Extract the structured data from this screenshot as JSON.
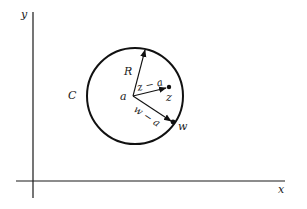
{
  "diagram": {
    "type": "complex-plane-circle",
    "axes": {
      "x_label": "x",
      "y_label": "y"
    },
    "circle": {
      "label": "C",
      "center_label": "a",
      "radius_label": "R"
    },
    "points": {
      "z_label": "z",
      "w_label": "w"
    },
    "vectors": {
      "z_minus_a": "z − a",
      "w_minus_a": "w − a"
    },
    "colors": {
      "stroke": "#111111",
      "background": "#ffffff"
    }
  }
}
